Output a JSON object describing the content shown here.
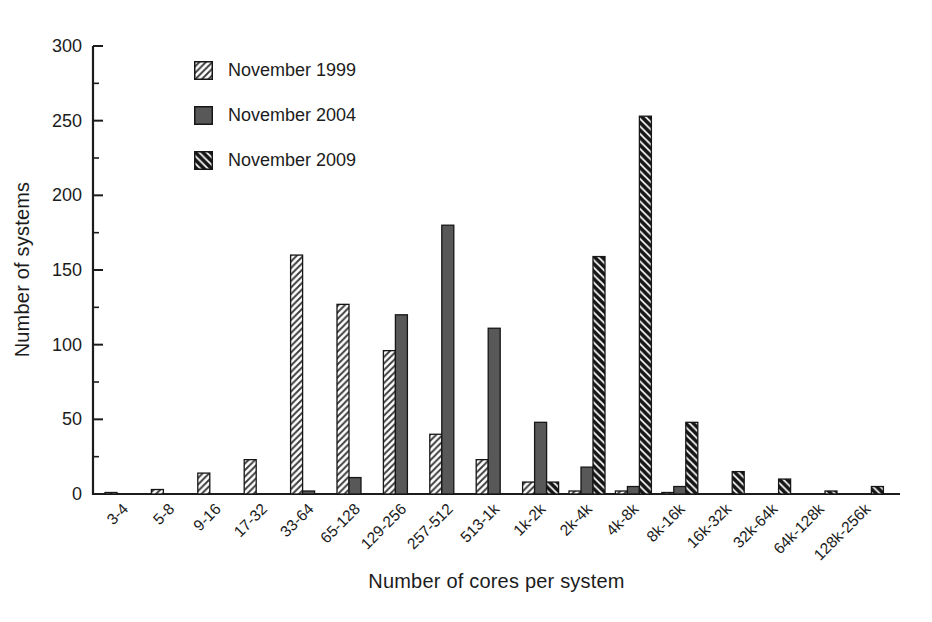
{
  "figure_title": "Distribution of TOP500 systems by cores per system",
  "chart_data": {
    "type": "bar",
    "title": "",
    "xlabel": "Number of cores per system",
    "ylabel": "Number of systems",
    "ylim": [
      0,
      300
    ],
    "ytick_step": 50,
    "yminor_step": 25,
    "grid": false,
    "legend_position": "upper-left-inside",
    "categories": [
      "3-4",
      "5-8",
      "9-16",
      "17-32",
      "33-64",
      "65-128",
      "129-256",
      "257-512",
      "513-1k",
      "1k-2k",
      "2k-4k",
      "4k-8k",
      "8k-16k",
      "16k-32k",
      "32k-64k",
      "64k-128k",
      "128k-256k"
    ],
    "series": [
      {
        "name": "November 1999",
        "pattern": "diagonal-forward-hatch",
        "color": "#3a3a3a",
        "values": [
          1,
          3,
          14,
          23,
          160,
          127,
          96,
          40,
          23,
          8,
          2,
          2,
          1,
          0,
          0,
          0,
          0
        ]
      },
      {
        "name": "November 2004",
        "pattern": "solid",
        "color": "#585858",
        "values": [
          0,
          0,
          0,
          0,
          2,
          11,
          120,
          180,
          111,
          48,
          18,
          5,
          5,
          0,
          0,
          0,
          0
        ]
      },
      {
        "name": "November 2009",
        "pattern": "diagonal-back-hatch",
        "color": "#161616",
        "values": [
          0,
          0,
          0,
          0,
          0,
          0,
          0,
          0,
          0,
          8,
          159,
          253,
          48,
          15,
          10,
          2,
          5
        ]
      }
    ]
  },
  "style": {
    "axis_color": "#1c1c1c",
    "bar_outline": "#161616",
    "tick_label_color": "#1c1c1c",
    "background": "#ffffff"
  }
}
